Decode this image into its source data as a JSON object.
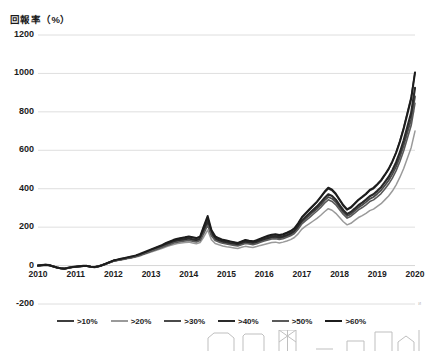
{
  "chart_data": {
    "type": "line",
    "title": "回報率（%）",
    "xlabel": "",
    "ylabel": "回報率（%）",
    "ylim": [
      -200,
      1200
    ],
    "ytick_values": [
      1200,
      1000,
      800,
      600,
      400,
      200,
      0,
      -200
    ],
    "ytick_labels": [
      "1200",
      "1000",
      "800",
      "600",
      "400",
      "200",
      "0",
      "-200"
    ],
    "xlim": [
      2010,
      2020
    ],
    "xtick_labels": [
      "2010",
      "2011",
      "2012",
      "2013",
      "2014",
      "2015",
      "2016",
      "2017",
      "2018",
      "2019",
      "2020"
    ],
    "grid": true,
    "legend_position": "bottom",
    "x": [
      2010.0,
      2010.1,
      2010.2,
      2010.3,
      2010.4,
      2010.5,
      2010.6,
      2010.7,
      2010.8,
      2010.9,
      2011.0,
      2011.1,
      2011.2,
      2011.3,
      2011.4,
      2011.5,
      2011.6,
      2011.7,
      2011.8,
      2011.9,
      2012.0,
      2012.1,
      2012.2,
      2012.3,
      2012.4,
      2012.5,
      2012.6,
      2012.7,
      2012.8,
      2012.9,
      2013.0,
      2013.1,
      2013.2,
      2013.3,
      2013.4,
      2013.5,
      2013.6,
      2013.7,
      2013.8,
      2013.9,
      2014.0,
      2014.1,
      2014.2,
      2014.3,
      2014.4,
      2014.5,
      2014.6,
      2014.7,
      2014.8,
      2014.9,
      2015.0,
      2015.1,
      2015.2,
      2015.3,
      2015.4,
      2015.5,
      2015.6,
      2015.7,
      2015.8,
      2015.9,
      2016.0,
      2016.1,
      2016.2,
      2016.3,
      2016.4,
      2016.5,
      2016.6,
      2016.7,
      2016.8,
      2016.9,
      2017.0,
      2017.1,
      2017.2,
      2017.3,
      2017.4,
      2017.5,
      2017.6,
      2017.7,
      2017.8,
      2017.9,
      2018.0,
      2018.1,
      2018.2,
      2018.3,
      2018.4,
      2018.5,
      2018.6,
      2018.7,
      2018.8,
      2018.9,
      2019.0,
      2019.1,
      2019.2,
      2019.3,
      2019.4,
      2019.5,
      2019.6,
      2019.7,
      2019.8,
      2019.9,
      2020.0
    ],
    "series": [
      {
        "name": ">10%",
        "color": "#3d3d3d",
        "width": 1.5,
        "values": [
          0,
          2,
          4,
          2,
          -4,
          -10,
          -14,
          -16,
          -12,
          -8,
          -6,
          -4,
          -2,
          -2,
          -6,
          -8,
          -4,
          2,
          10,
          18,
          26,
          30,
          34,
          38,
          42,
          46,
          52,
          58,
          66,
          74,
          82,
          90,
          98,
          106,
          116,
          124,
          132,
          138,
          142,
          146,
          150,
          146,
          142,
          150,
          200,
          250,
          180,
          150,
          140,
          132,
          128,
          124,
          120,
          116,
          124,
          132,
          128,
          124,
          130,
          138,
          146,
          152,
          158,
          160,
          156,
          160,
          168,
          176,
          190,
          215,
          250,
          270,
          290,
          310,
          330,
          355,
          380,
          400,
          390,
          370,
          340,
          310,
          290,
          300,
          320,
          340,
          355,
          370,
          390,
          400,
          420,
          440,
          470,
          500,
          540,
          590,
          650,
          720,
          800,
          880,
          1005
        ]
      },
      {
        "name": ">20%",
        "color": "#9a9a9a",
        "width": 1.5,
        "values": [
          0,
          1,
          3,
          1,
          -5,
          -11,
          -15,
          -17,
          -13,
          -9,
          -7,
          -5,
          -3,
          -3,
          -7,
          -9,
          -5,
          1,
          8,
          15,
          22,
          26,
          29,
          33,
          37,
          40,
          45,
          50,
          57,
          64,
          70,
          77,
          84,
          90,
          98,
          104,
          110,
          115,
          118,
          120,
          122,
          118,
          114,
          120,
          150,
          185,
          135,
          115,
          108,
          102,
          98,
          95,
          92,
          89,
          95,
          100,
          97,
          94,
          99,
          105,
          110,
          115,
          120,
          122,
          118,
          122,
          128,
          135,
          146,
          165,
          190,
          205,
          218,
          232,
          246,
          262,
          280,
          296,
          288,
          272,
          250,
          228,
          212,
          220,
          235,
          250,
          260,
          272,
          286,
          294,
          308,
          322,
          342,
          362,
          388,
          420,
          460,
          505,
          560,
          615,
          700
        ]
      },
      {
        "name": ">30%",
        "color": "#4a4a4a",
        "width": 1.8,
        "values": [
          0,
          2,
          4,
          2,
          -4,
          -10,
          -14,
          -16,
          -12,
          -8,
          -6,
          -4,
          -2,
          -2,
          -6,
          -8,
          -4,
          2,
          9,
          17,
          24,
          28,
          32,
          36,
          40,
          44,
          49,
          55,
          62,
          70,
          77,
          85,
          92,
          99,
          108,
          115,
          122,
          128,
          131,
          134,
          137,
          133,
          129,
          136,
          178,
          222,
          162,
          136,
          128,
          121,
          117,
          113,
          110,
          107,
          113,
          120,
          117,
          114,
          119,
          126,
          133,
          139,
          144,
          146,
          142,
          146,
          153,
          161,
          174,
          197,
          226,
          244,
          261,
          279,
          296,
          316,
          339,
          357,
          348,
          330,
          303,
          277,
          258,
          268,
          285,
          302,
          315,
          330,
          347,
          357,
          374,
          392,
          417,
          443,
          476,
          516,
          566,
          625,
          694,
          762,
          880
        ]
      },
      {
        "name": ">40%",
        "color": "#2a2a2a",
        "width": 2.2,
        "values": [
          0,
          2,
          4,
          2,
          -4,
          -10,
          -14,
          -16,
          -12,
          -8,
          -6,
          -4,
          -2,
          -2,
          -6,
          -8,
          -4,
          2,
          9,
          17,
          25,
          29,
          33,
          37,
          41,
          45,
          50,
          56,
          63,
          71,
          79,
          87,
          94,
          102,
          111,
          118,
          126,
          132,
          135,
          138,
          141,
          137,
          133,
          140,
          185,
          232,
          168,
          141,
          132,
          125,
          121,
          117,
          114,
          111,
          117,
          124,
          121,
          118,
          123,
          131,
          138,
          144,
          150,
          152,
          148,
          152,
          159,
          167,
          181,
          205,
          235,
          254,
          272,
          290,
          308,
          329,
          352,
          371,
          362,
          343,
          315,
          288,
          268,
          279,
          296,
          314,
          328,
          343,
          361,
          371,
          389,
          408,
          434,
          461,
          496,
          538,
          590,
          652,
          724,
          796,
          925
        ]
      },
      {
        "name": ">50%",
        "color": "#5a5a5a",
        "width": 1.6,
        "values": [
          0,
          2,
          4,
          2,
          -4,
          -10,
          -14,
          -16,
          -12,
          -8,
          -6,
          -4,
          -2,
          -2,
          -6,
          -8,
          -4,
          2,
          9,
          16,
          23,
          27,
          31,
          35,
          39,
          42,
          47,
          53,
          60,
          67,
          74,
          81,
          88,
          95,
          103,
          110,
          117,
          122,
          125,
          128,
          131,
          127,
          123,
          130,
          168,
          210,
          155,
          130,
          122,
          116,
          112,
          108,
          105,
          102,
          108,
          115,
          112,
          109,
          114,
          121,
          128,
          133,
          138,
          140,
          136,
          140,
          147,
          155,
          167,
          189,
          217,
          234,
          250,
          267,
          284,
          303,
          325,
          342,
          334,
          316,
          291,
          266,
          247,
          257,
          273,
          290,
          302,
          316,
          333,
          342,
          358,
          375,
          399,
          424,
          455,
          494,
          542,
          598,
          664,
          730,
          845
        ]
      },
      {
        "name": ">60%",
        "color": "#1c1c1c",
        "width": 2.0,
        "values": [
          0,
          2,
          4,
          2,
          -4,
          -10,
          -14,
          -16,
          -12,
          -8,
          -6,
          -4,
          -2,
          -2,
          -6,
          -8,
          -4,
          2,
          10,
          18,
          26,
          31,
          35,
          39,
          44,
          48,
          53,
          60,
          68,
          76,
          84,
          92,
          100,
          108,
          118,
          126,
          134,
          140,
          144,
          147,
          151,
          147,
          143,
          151,
          205,
          258,
          185,
          152,
          142,
          134,
          130,
          126,
          122,
          118,
          126,
          133,
          129,
          126,
          132,
          140,
          148,
          155,
          161,
          163,
          159,
          163,
          171,
          180,
          194,
          220,
          252,
          273,
          293,
          313,
          333,
          358,
          384,
          405,
          395,
          374,
          344,
          314,
          292,
          304,
          323,
          343,
          358,
          374,
          394,
          405,
          424,
          445,
          473,
          503,
          542,
          588,
          645,
          712,
          790,
          868,
          1005
        ]
      }
    ]
  }
}
